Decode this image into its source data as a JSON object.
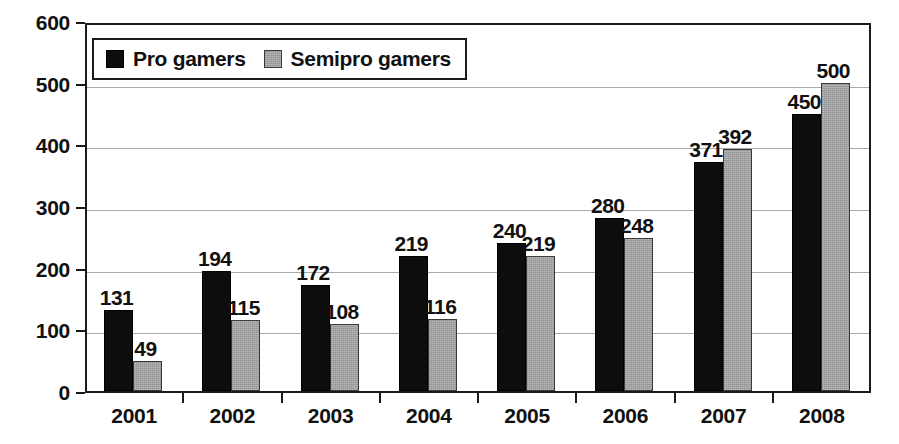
{
  "chart_data": {
    "type": "bar",
    "title": "",
    "subtitle": "",
    "xlabel": "",
    "ylabel": "",
    "categories": [
      "2001",
      "2002",
      "2003",
      "2004",
      "2005",
      "2006",
      "2007",
      "2008"
    ],
    "series": [
      {
        "name": "Pro gamers",
        "color": "#0d0d0d",
        "values": [
          131,
          194,
          172,
          219,
          240,
          280,
          371,
          450
        ]
      },
      {
        "name": "Semipro gamers",
        "color": "#a2a2a2",
        "values": [
          49,
          115,
          108,
          116,
          219,
          248,
          392,
          500
        ]
      }
    ],
    "ylim": [
      0,
      600
    ],
    "y_ticks": [
      0,
      100,
      200,
      300,
      400,
      500,
      600
    ],
    "y_tick_labels": [
      "0",
      "100",
      "200",
      "300",
      "400",
      "500",
      "600"
    ],
    "grid": true,
    "grid_axis": "y",
    "data_labels": true,
    "legend_position": "top-left"
  },
  "legend": {
    "entries": [
      {
        "label": "Pro gamers",
        "swatch": "black-square-swatch"
      },
      {
        "label": "Semipro gamers",
        "swatch": "gray-square-swatch"
      }
    ]
  }
}
